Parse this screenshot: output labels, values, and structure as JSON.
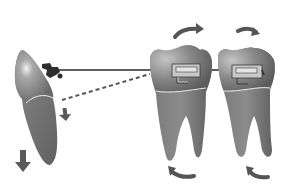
{
  "diagram": {
    "type": "orthodontic-mechanics-illustration",
    "colors": {
      "background": "#ffffff",
      "tooth_crown": "#7c7c7c",
      "tooth_crown_highlight": "#c8c8c8",
      "tooth_root": "#6e6e6e",
      "cej_line": "#e8e8e8",
      "arrow": "#555555",
      "archwire": "#2a2a2a",
      "bracket_fill": "#d4d4d4",
      "bracket_stroke": "#3a3a3a",
      "dashed_line": "#555555"
    },
    "elements": {
      "incisor": {
        "label": ""
      },
      "molar_1": {
        "label": ""
      },
      "molar_2": {
        "label": ""
      },
      "archwire": {
        "label": ""
      },
      "elastic_dashed": {
        "label": ""
      }
    }
  }
}
